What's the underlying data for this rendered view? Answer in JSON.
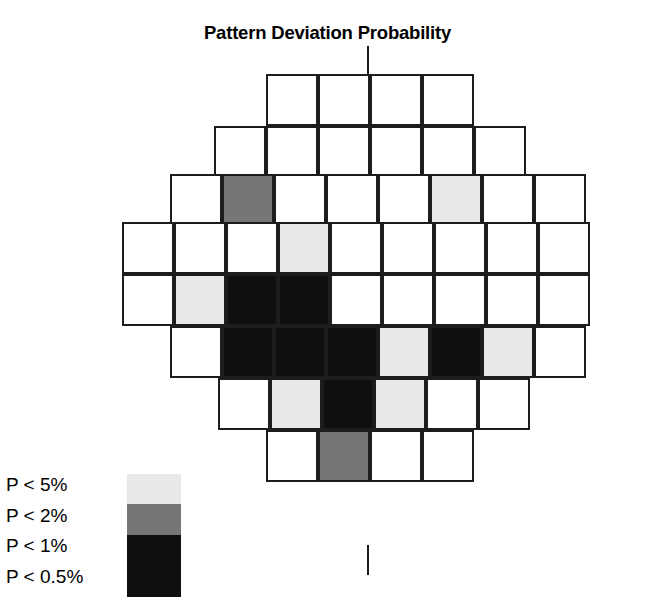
{
  "title": "Pattern Deviation Probability",
  "legend": {
    "items": [
      {
        "label": "P < 5%",
        "color": "#e9e9e9"
      },
      {
        "label": "P < 2%",
        "color": "#767676"
      },
      {
        "label": "P < 1%",
        "color": "#101010"
      },
      {
        "label": "P < 0.5%",
        "color": "#101010"
      }
    ]
  },
  "colors": {
    "normal": "#ffffff",
    "p5": "#e9e9e9",
    "p2": "#767676",
    "p1": "#101010",
    "p05": "#101010",
    "border": "#1d1d1d",
    "meridian": "#1a1a1a"
  },
  "chart_data": {
    "type": "heatmap",
    "title": "Pattern Deviation Probability",
    "xlabel": "",
    "ylabel": "",
    "grid": true,
    "legend_position": "bottom-left",
    "cell_size": 52,
    "value_scale": [
      "normal",
      "p5",
      "p2",
      "p1"
    ],
    "rows": [
      {
        "index": 1,
        "x_start": 266,
        "y": 74,
        "count": 4,
        "values": [
          "normal",
          "normal",
          "normal",
          "normal"
        ]
      },
      {
        "index": 2,
        "x_start": 214,
        "y": 126,
        "count": 6,
        "values": [
          "normal",
          "normal",
          "normal",
          "normal",
          "normal",
          "normal"
        ]
      },
      {
        "index": 3,
        "x_start": 170,
        "y": 174,
        "count": 8,
        "values": [
          "normal",
          "p2",
          "normal",
          "normal",
          "normal",
          "p5",
          "normal",
          "normal"
        ]
      },
      {
        "index": 4,
        "x_start": 122,
        "y": 222,
        "count": 9,
        "values": [
          "normal",
          "normal",
          "normal",
          "p5",
          "normal",
          "normal",
          "normal",
          "normal",
          "normal"
        ]
      },
      {
        "index": 5,
        "x_start": 122,
        "y": 274,
        "count": 9,
        "values": [
          "normal",
          "p5",
          "p1",
          "p1",
          "normal",
          "normal",
          "normal",
          "normal",
          "normal"
        ]
      },
      {
        "index": 6,
        "x_start": 170,
        "y": 326,
        "count": 8,
        "values": [
          "normal",
          "p1",
          "p1",
          "p1",
          "p5",
          "p1",
          "p5",
          "normal"
        ]
      },
      {
        "index": 7,
        "x_start": 218,
        "y": 378,
        "count": 6,
        "values": [
          "normal",
          "p5",
          "p1",
          "p5",
          "normal",
          "normal"
        ]
      },
      {
        "index": 8,
        "x_start": 266,
        "y": 430,
        "count": 4,
        "values": [
          "normal",
          "p2",
          "normal",
          "normal"
        ]
      }
    ],
    "counts": {
      "total_cells": 54,
      "normal": 36,
      "p5": 8,
      "p2": 2,
      "p1": 8
    }
  }
}
